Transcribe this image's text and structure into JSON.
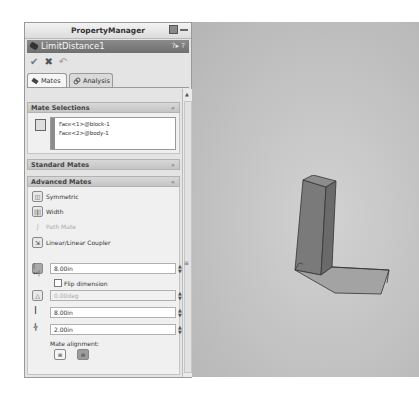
{
  "property_manager": {
    "title": "PropertyManager",
    "feature_name": "LimitDistance1",
    "help_icons": "?▸ ?",
    "actions": {
      "ok": "✔",
      "cancel": "✖",
      "undo": "↶"
    },
    "tabs": [
      {
        "label": "Mates",
        "active": true
      },
      {
        "label": "Analysis",
        "active": false
      }
    ],
    "sections": {
      "mate_selections": {
        "title": "Mate Selections",
        "items": [
          "Face<1>@block-1",
          "Face<2>@body-1"
        ]
      },
      "standard_mates": {
        "title": "Standard Mates"
      },
      "advanced_mates": {
        "title": "Advanced Mates",
        "options": [
          {
            "label": "Symmetric",
            "enabled": true
          },
          {
            "label": "Width",
            "enabled": true
          },
          {
            "label": "Path Mate",
            "enabled": false
          },
          {
            "label": "Linear/Linear Coupler",
            "enabled": true
          }
        ],
        "distance_value": "8.00in",
        "flip_dimension_label": "Flip dimension",
        "flip_dimension_checked": false,
        "angle_value": "0.00deg",
        "max_value": "8.00in",
        "min_value": "2.00in",
        "mate_alignment_label": "Mate alignment:"
      }
    }
  },
  "viewport": {
    "background": "#c4c4c4",
    "model": "L-shaped block assembly"
  }
}
